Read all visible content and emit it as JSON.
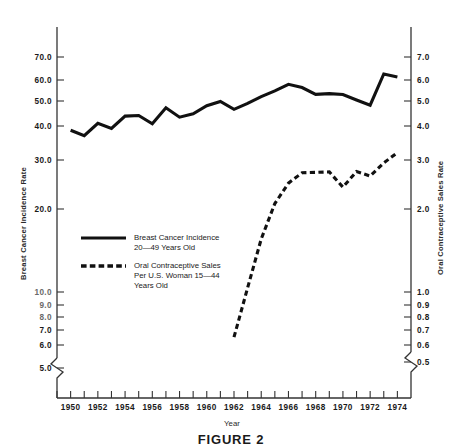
{
  "figure": {
    "caption": "FIGURE 2"
  },
  "chart_data": {
    "type": "line",
    "title": "FIGURE 2",
    "xlabel": "Year",
    "ylabel": "Breast Cancer Incidence Rate",
    "y2label": "Oral Contraceptive Sales Rate",
    "grid": false,
    "legend_position": "center-left",
    "xlim": [
      1949,
      1975
    ],
    "x_tick_labels": [
      "1950",
      "1952",
      "1954",
      "1956",
      "1958",
      "1960",
      "1962",
      "1964",
      "1966",
      "1968",
      "1970",
      "1972",
      "1974"
    ],
    "x_minor_ticks": [
      1949,
      1950,
      1951,
      1952,
      1953,
      1954,
      1955,
      1956,
      1957,
      1958,
      1959,
      1960,
      1961,
      1962,
      1963,
      1964,
      1965,
      1966,
      1967,
      1968,
      1969,
      1970,
      1971,
      1972,
      1973,
      1974
    ],
    "y_axis": {
      "scale": "log",
      "axis_break": true,
      "tick_labels": [
        "70.0",
        "60.0",
        "50.0",
        "40.0",
        "30.0",
        "20.0",
        "10.0",
        "9.0",
        "8.0",
        "7.0",
        "6.0",
        "5.0"
      ],
      "tick_values": [
        70.0,
        60.0,
        50.0,
        40.0,
        30.0,
        20.0,
        10.0,
        9.0,
        8.0,
        7.0,
        6.0,
        5.0
      ]
    },
    "y2_axis": {
      "scale": "log",
      "axis_break": true,
      "tick_labels": [
        "7.0",
        "6.0",
        "5.0",
        "4.0",
        "3.0",
        "2.0",
        "1.0",
        "0.9",
        "0.8",
        "0.7",
        "0.6",
        "0.5"
      ],
      "tick_values": [
        7.0,
        6.0,
        5.0,
        4.0,
        3.0,
        2.0,
        1.0,
        0.9,
        0.8,
        0.7,
        0.6,
        0.5
      ]
    },
    "series": [
      {
        "name": "Breast Cancer Incidence 20-49 Years Old",
        "style": "solid",
        "axis": "left",
        "x": [
          1950,
          1951,
          1952,
          1953,
          1954,
          1955,
          1956,
          1957,
          1958,
          1959,
          1960,
          1961,
          1962,
          1963,
          1964,
          1965,
          1966,
          1967,
          1968,
          1969,
          1970,
          1971,
          1972,
          1973,
          1974
        ],
        "values": [
          37.6,
          35.9,
          39.9,
          38.2,
          42.4,
          42.6,
          39.7,
          45.5,
          42.0,
          43.2,
          46.3,
          48.0,
          44.9,
          47.2,
          50.0,
          52.5,
          55.5,
          54.0,
          51.0,
          51.3,
          50.9,
          48.6,
          46.5,
          60.6,
          59.1
        ]
      },
      {
        "name": "Oral Contraceptive Sales Per U.S. Woman 15-44 Years Old",
        "style": "dashed",
        "axis": "right",
        "x": [
          1962,
          1963,
          1964,
          1965,
          1966,
          1967,
          1968,
          1969,
          1970,
          1971,
          1972,
          1973,
          1974
        ],
        "values": [
          0.62,
          0.95,
          1.45,
          1.97,
          2.35,
          2.57,
          2.58,
          2.59,
          2.27,
          2.6,
          2.5,
          2.8,
          3.06
        ]
      }
    ],
    "legend": [
      {
        "style": "solid",
        "lines": [
          "Breast Cancer Incidence",
          "20—49 Years Old"
        ]
      },
      {
        "style": "dashed",
        "lines": [
          "Oral Contraceptive Sales",
          "Per U.S. Woman 15—44",
          "Years Old"
        ]
      }
    ]
  }
}
